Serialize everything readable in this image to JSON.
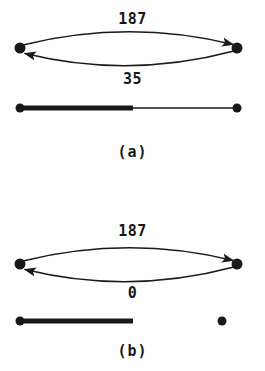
{
  "figure": {
    "background_color": "#fefefe",
    "ink_color": "#191919",
    "panels": [
      {
        "id": "a",
        "caption": "(a)",
        "graph": {
          "nodes": [
            {
              "id": "left",
              "x": 20,
              "y": 48,
              "radius": 5.5,
              "filled": true
            },
            {
              "id": "right",
              "x": 237,
              "y": 48,
              "radius": 5.5,
              "filled": true
            }
          ],
          "edges": [
            {
              "id": "top-edge",
              "from": "left",
              "to": "right",
              "direction": "left-to-right",
              "label": "187",
              "label_position": "above",
              "curve": "arc-up"
            },
            {
              "id": "bottom-edge",
              "from": "right",
              "to": "left",
              "direction": "right-to-left",
              "label": "35",
              "label_position": "below",
              "curve": "arc-down"
            }
          ]
        },
        "bar": {
          "id": "capacity-bar",
          "x_start": 20,
          "x_end": 237,
          "fill_end": 133,
          "y": 108,
          "fill_thickness": 5,
          "track_thickness": 1.4,
          "endpoint_radius": 4.5,
          "left_endpoint_filled": true,
          "right_endpoint_filled": true
        },
        "labels": {
          "top": "187",
          "bottom": "35"
        }
      },
      {
        "id": "b",
        "caption": "(b)",
        "graph": {
          "nodes": [
            {
              "id": "left",
              "x": 20,
              "y": 48,
              "radius": 5.5,
              "filled": true
            },
            {
              "id": "right",
              "x": 237,
              "y": 48,
              "radius": 5.5,
              "filled": true
            }
          ],
          "edges": [
            {
              "id": "top-edge",
              "from": "left",
              "to": "right",
              "direction": "left-to-right",
              "label": "187",
              "label_position": "above",
              "curve": "arc-up"
            },
            {
              "id": "bottom-edge",
              "from": "right",
              "to": "left",
              "direction": "right-to-left",
              "label": "0",
              "label_position": "below",
              "curve": "arc-down"
            }
          ]
        },
        "bar": {
          "id": "capacity-bar",
          "x_start": 20,
          "x_end": 133,
          "fill_end": 133,
          "y": 135,
          "fill_thickness": 5,
          "track_thickness": 0,
          "endpoint_radius": 4.5,
          "left_endpoint_filled": true,
          "right_endpoint_filled": false,
          "detached_endpoint_x": 222
        },
        "labels": {
          "top": "187",
          "bottom": "0"
        }
      }
    ]
  }
}
